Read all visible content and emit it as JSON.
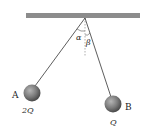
{
  "diagram": {
    "type": "physics-pendulum",
    "ceiling": {
      "color": "#8c8c8c"
    },
    "angles": {
      "left": "α",
      "right": "β"
    },
    "ball_a": {
      "label": "A",
      "charge": "2Q",
      "color": "#7a7a7a"
    },
    "ball_b": {
      "label": "B",
      "charge": "Q",
      "color": "#7a7a7a"
    }
  }
}
